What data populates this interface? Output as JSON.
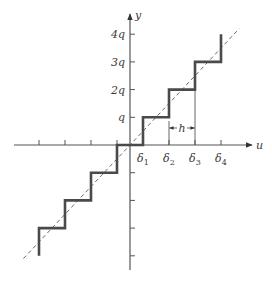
{
  "figure": {
    "type": "quantizer staircase characteristic",
    "axes": {
      "x_label": "u",
      "y_label": "y"
    },
    "y_tick_labels": [
      "q",
      "2q",
      "3q",
      "4q"
    ],
    "x_tick_labels": [
      "δ1",
      "δ2",
      "δ3",
      "δ4"
    ],
    "x_tick_labels_parts": [
      {
        "base": "δ",
        "sub": "1"
      },
      {
        "base": "δ",
        "sub": "2"
      },
      {
        "base": "δ",
        "sub": "3"
      },
      {
        "base": "δ",
        "sub": "4"
      }
    ],
    "step_width_label": "h",
    "quantizer": {
      "kind": "mid-tread",
      "levels_in_units_of_q": [
        -4,
        -3,
        -2,
        -1,
        0,
        1,
        2,
        3,
        4
      ],
      "thresholds_in_units_of_h": [
        -3.5,
        -2.5,
        -1.5,
        -0.5,
        0.5,
        1.5,
        2.5,
        3.5
      ],
      "positive_thresholds_labels": [
        "δ1",
        "δ2",
        "δ3",
        "δ4"
      ]
    },
    "reference_line": {
      "style": "dashed",
      "slope": "q/h",
      "description": "linear (unquantized) characteristic y = (q/h) u"
    },
    "colors": {
      "staircase": "#4a4a4a",
      "axes": "#555555",
      "dashed_line": "#6a6a6a",
      "text": "#3a3a3a"
    }
  }
}
